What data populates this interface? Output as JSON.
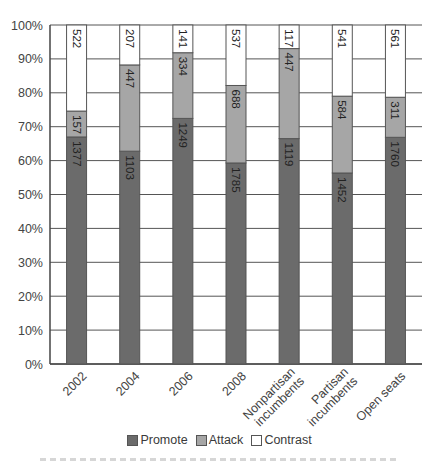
{
  "chart_data": {
    "type": "bar",
    "stacked": true,
    "normalized_percent": true,
    "title": "",
    "xlabel": "",
    "ylabel": "",
    "ylim": [
      0,
      100
    ],
    "yticks": [
      "0%",
      "10%",
      "20%",
      "30%",
      "40%",
      "50%",
      "60%",
      "70%",
      "80%",
      "90%",
      "100%"
    ],
    "grid": "horizontal",
    "legend_position": "bottom",
    "categories": [
      "2002",
      "2004",
      "2006",
      "2008",
      "Nonpartisan incumbents",
      "Partisan incumbents",
      "Open seats"
    ],
    "category_lines": [
      [
        "2002"
      ],
      [
        "2004"
      ],
      [
        "2006"
      ],
      [
        "2008"
      ],
      [
        "Nonpartisan",
        "incumbents"
      ],
      [
        "Partisan",
        "incumbents"
      ],
      [
        "Open seats"
      ]
    ],
    "series": [
      {
        "name": "Promote",
        "color": "#6b6b6b",
        "values": [
          1377,
          1103,
          1249,
          1785,
          1119,
          1452,
          1760
        ]
      },
      {
        "name": "Attack",
        "color": "#a6a6a6",
        "values": [
          157,
          447,
          334,
          688,
          447,
          584,
          311
        ]
      },
      {
        "name": "Contrast",
        "color": "#ffffff",
        "values": [
          522,
          207,
          141,
          537,
          117,
          541,
          561
        ]
      }
    ]
  },
  "legend": {
    "items": [
      {
        "label": "Promote",
        "color": "#6b6b6b"
      },
      {
        "label": "Attack",
        "color": "#a6a6a6"
      },
      {
        "label": "Contrast",
        "color": "#ffffff"
      }
    ]
  }
}
